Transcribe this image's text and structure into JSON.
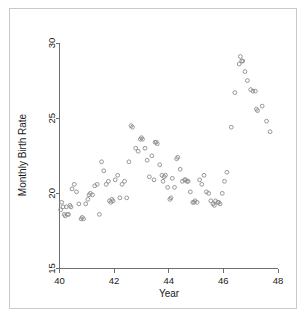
{
  "figure": {
    "border_color": "#c9c9c9",
    "background": "#ffffff"
  },
  "chart_data": {
    "type": "scatter",
    "title": "",
    "xlabel": "Year",
    "ylabel": "Monthly Birth Rate",
    "xlim": [
      40,
      48
    ],
    "ylim": [
      15,
      30
    ],
    "xticks": [
      40,
      42,
      44,
      46,
      48
    ],
    "xtick_labels": [
      "40",
      "42",
      "44",
      "46",
      "48"
    ],
    "yticks": [
      15,
      20,
      25,
      30
    ],
    "ytick_labels": [
      "15",
      "20",
      "25",
      "30"
    ],
    "grid": false,
    "legend": null,
    "marker": "open-circle",
    "marker_color": "#8c8c8c",
    "axis_color": "#6e6e6e",
    "points": [
      [
        40.04,
        18.9
      ],
      [
        40.08,
        19.4
      ],
      [
        40.13,
        19.1
      ],
      [
        40.17,
        18.6
      ],
      [
        40.21,
        18.5
      ],
      [
        40.25,
        19.1
      ],
      [
        40.29,
        18.6
      ],
      [
        40.33,
        18.6
      ],
      [
        40.38,
        19.2
      ],
      [
        40.42,
        19.1
      ],
      [
        40.46,
        20.3
      ],
      [
        40.54,
        20.6
      ],
      [
        40.62,
        20.1
      ],
      [
        40.71,
        19.3
      ],
      [
        40.79,
        18.3
      ],
      [
        40.83,
        18.4
      ],
      [
        40.88,
        18.3
      ],
      [
        40.96,
        19.3
      ],
      [
        41.04,
        19.6
      ],
      [
        41.08,
        19.9
      ],
      [
        41.13,
        20.0
      ],
      [
        41.21,
        19.9
      ],
      [
        41.29,
        20.5
      ],
      [
        41.38,
        20.6
      ],
      [
        41.46,
        18.6
      ],
      [
        41.54,
        22.1
      ],
      [
        41.62,
        21.5
      ],
      [
        41.71,
        20.6
      ],
      [
        41.79,
        20.8
      ],
      [
        41.83,
        19.5
      ],
      [
        41.88,
        19.4
      ],
      [
        41.92,
        19.6
      ],
      [
        41.96,
        19.5
      ],
      [
        42.04,
        20.9
      ],
      [
        42.13,
        21.2
      ],
      [
        42.21,
        19.7
      ],
      [
        42.29,
        20.6
      ],
      [
        42.38,
        20.8
      ],
      [
        42.46,
        19.7
      ],
      [
        42.54,
        22.1
      ],
      [
        42.62,
        24.5
      ],
      [
        42.67,
        24.4
      ],
      [
        42.79,
        23.0
      ],
      [
        42.88,
        22.8
      ],
      [
        42.96,
        23.6
      ],
      [
        43.0,
        23.7
      ],
      [
        43.04,
        23.6
      ],
      [
        43.13,
        23.0
      ],
      [
        43.21,
        22.2
      ],
      [
        43.29,
        21.1
      ],
      [
        43.38,
        22.5
      ],
      [
        43.46,
        20.9
      ],
      [
        43.5,
        23.4
      ],
      [
        43.54,
        23.4
      ],
      [
        43.58,
        23.3
      ],
      [
        43.67,
        21.9
      ],
      [
        43.75,
        21.2
      ],
      [
        43.79,
        20.8
      ],
      [
        43.83,
        21.1
      ],
      [
        43.88,
        21.2
      ],
      [
        43.96,
        20.4
      ],
      [
        44.04,
        19.6
      ],
      [
        44.08,
        19.7
      ],
      [
        44.13,
        21.0
      ],
      [
        44.21,
        20.4
      ],
      [
        44.29,
        22.3
      ],
      [
        44.33,
        22.4
      ],
      [
        44.42,
        21.6
      ],
      [
        44.5,
        20.8
      ],
      [
        44.58,
        20.9
      ],
      [
        44.62,
        20.9
      ],
      [
        44.67,
        20.8
      ],
      [
        44.71,
        20.8
      ],
      [
        44.79,
        20.1
      ],
      [
        44.88,
        19.4
      ],
      [
        44.92,
        19.4
      ],
      [
        44.96,
        19.5
      ],
      [
        45.04,
        19.4
      ],
      [
        45.13,
        20.9
      ],
      [
        45.21,
        20.6
      ],
      [
        45.29,
        21.2
      ],
      [
        45.38,
        20.1
      ],
      [
        45.46,
        20.0
      ],
      [
        45.54,
        19.5
      ],
      [
        45.62,
        19.3
      ],
      [
        45.67,
        19.2
      ],
      [
        45.71,
        19.5
      ],
      [
        45.79,
        19.4
      ],
      [
        45.83,
        19.4
      ],
      [
        45.88,
        19.3
      ],
      [
        45.96,
        20.0
      ],
      [
        46.04,
        20.8
      ],
      [
        46.13,
        21.4
      ],
      [
        46.29,
        24.4
      ],
      [
        46.42,
        26.7
      ],
      [
        46.58,
        28.6
      ],
      [
        46.62,
        29.1
      ],
      [
        46.67,
        28.8
      ],
      [
        46.71,
        28.8
      ],
      [
        46.79,
        28.1
      ],
      [
        46.88,
        27.5
      ],
      [
        47.0,
        26.9
      ],
      [
        47.08,
        26.8
      ],
      [
        47.17,
        26.8
      ],
      [
        47.21,
        25.6
      ],
      [
        47.25,
        25.5
      ],
      [
        47.42,
        25.8
      ],
      [
        47.58,
        24.8
      ],
      [
        47.71,
        24.1
      ]
    ]
  }
}
